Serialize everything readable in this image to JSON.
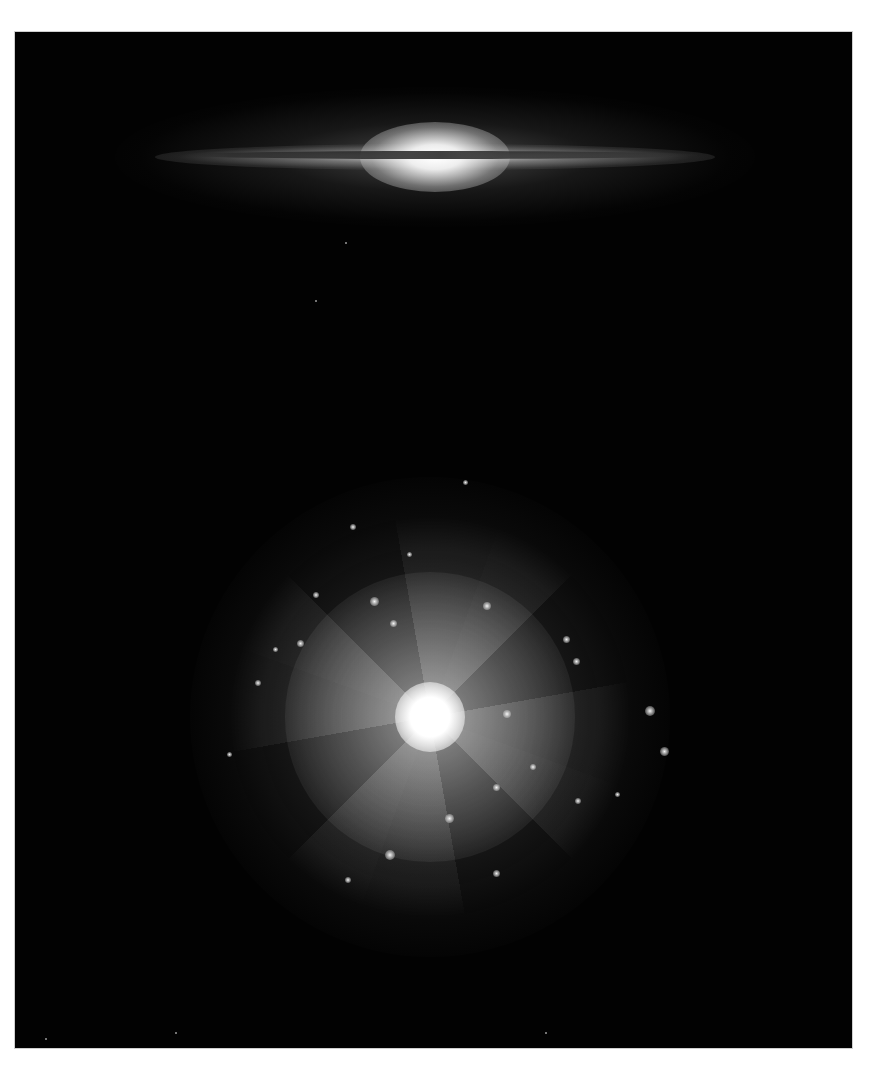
{
  "image": {
    "description": "Two galaxies on black background: an edge-on spiral with dust lane at top, and a face-on grand-design spiral below",
    "background_color": "#020202",
    "border_color": "#ffffff",
    "edge_on_galaxy": {
      "center": [
        430,
        155
      ],
      "span_x": [
        160,
        720
      ],
      "dust_lane": true
    },
    "face_on_galaxy": {
      "center": [
        430,
        720
      ],
      "disk_radius": 130,
      "arm_extent_radius": 230
    }
  }
}
